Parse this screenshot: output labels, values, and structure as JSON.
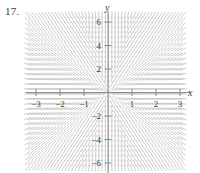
{
  "figure": {
    "problem_number": "17.",
    "axis_labels": {
      "x": "x",
      "y": "y"
    }
  },
  "chart_data": {
    "type": "scatter",
    "plot_kind": "slope-field",
    "title": "",
    "subtitle": "",
    "xlabel": "x",
    "ylabel": "y",
    "xlim": [
      -3.35,
      3.35
    ],
    "ylim": [
      -6.6,
      6.6
    ],
    "grid": false,
    "legend": null,
    "annotations": [
      "17."
    ],
    "xticks": [
      -3,
      -2,
      -1,
      1,
      2,
      3
    ],
    "xtick_labels": [
      "−3",
      "−2",
      "−1",
      "1",
      "2",
      "3"
    ],
    "yticks": [
      6,
      4,
      2,
      -2,
      -4,
      -6
    ],
    "ytick_labels": [
      "6",
      "4",
      "2",
      "−2",
      "−4",
      "−6"
    ],
    "stroke_color": "#b8b8b8",
    "axis_color": "#8a8a8a",
    "background_color": "#ffffff",
    "slope_expression": "y/x",
    "slope_description": "Slope marks are nearly horizontal far from the y-axis and become steep and nearly vertical as x approaches 0; marks tilt downward-right in the upper-left and lower-right regions and upward-right in the upper-right and lower-left regions.",
    "field_sample_x": [
      -3.0,
      -2.75,
      -2.5,
      -2.25,
      -2.0,
      -1.75,
      -1.5,
      -1.25,
      -1.0,
      -0.75,
      -0.5,
      -0.25,
      0.25,
      0.5,
      0.75,
      1.0,
      1.25,
      1.5,
      1.75,
      2.0,
      2.25,
      2.5,
      2.75,
      3.0
    ],
    "field_sample_y": [
      -6.0,
      -5.5,
      -5.0,
      -4.5,
      -4.0,
      -3.5,
      -3.0,
      -2.5,
      -2.0,
      -1.5,
      -1.0,
      -0.5,
      0.5,
      1.0,
      1.5,
      2.0,
      2.5,
      3.0,
      3.5,
      4.0,
      4.5,
      5.0,
      5.5,
      6.0
    ],
    "mark_length_px": 7,
    "geometry": {
      "origin_px": [
        108,
        92.5
      ],
      "x_scale_px_per_unit": 24,
      "y_scale_px_per_unit": 11.75
    }
  }
}
